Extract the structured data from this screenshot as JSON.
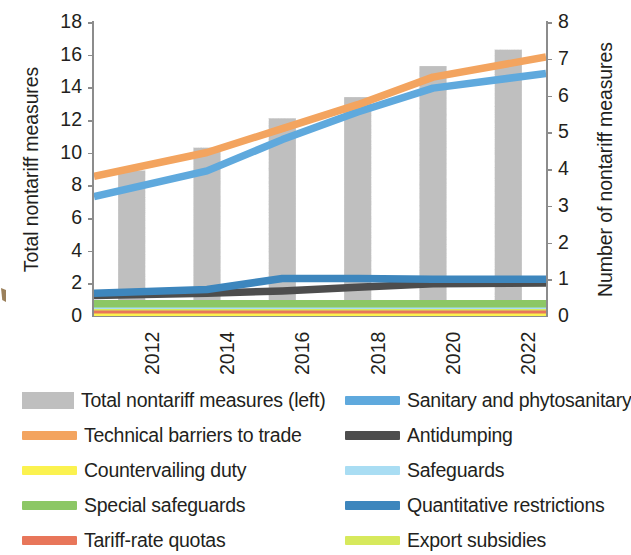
{
  "axes": {
    "y_left": {
      "title": "Total nontariff measures",
      "ticks": [
        "18",
        "16",
        "14",
        "12",
        "10",
        "8",
        "6",
        "4",
        "2",
        "0"
      ],
      "min": 0,
      "max": 18,
      "step": 2
    },
    "y_right": {
      "title": "Number of nontariff  measures",
      "ticks": [
        "8",
        "7",
        "6",
        "5",
        "4",
        "3",
        "2",
        "1",
        "0"
      ],
      "min": 0,
      "max": 8,
      "step": 1
    },
    "x": {
      "ticks": [
        "2012",
        "2014",
        "2016",
        "2018",
        "2020",
        "2022"
      ]
    }
  },
  "legend": {
    "left_column": [
      {
        "label": "Total  nontariff measures (left)",
        "color": "#bfbfbf",
        "style": "patch",
        "icon": "bar-swatch-icon"
      },
      {
        "label": "Technical barriers to trade",
        "color": "#f3a45f",
        "style": "line",
        "icon": "line-swatch-icon"
      },
      {
        "label": "Countervailing duty",
        "color": "#fbf24f",
        "style": "line",
        "icon": "line-swatch-icon"
      },
      {
        "label": "Special safeguards",
        "color": "#8cc765",
        "style": "line",
        "icon": "line-swatch-icon"
      },
      {
        "label": "Tariff-rate quotas",
        "color": "#e8765a",
        "style": "line",
        "icon": "line-swatch-icon"
      }
    ],
    "right_column": [
      {
        "label": "Sanitary and phytosanitary",
        "color": "#5fa9dd",
        "style": "line",
        "icon": "line-swatch-icon"
      },
      {
        "label": "Antidumping",
        "color": "#4d4d4d",
        "style": "line",
        "icon": "line-swatch-icon"
      },
      {
        "label": "Safeguards",
        "color": "#a9ddf3",
        "style": "line",
        "icon": "line-swatch-icon"
      },
      {
        "label": "Quantitative restrictions",
        "color": "#3d86bd",
        "style": "line",
        "icon": "line-swatch-icon"
      },
      {
        "label": "Export subsidies",
        "color": "#d7e95c",
        "style": "line",
        "icon": "line-swatch-icon"
      }
    ]
  },
  "chart_data": {
    "type": "bar",
    "title": "",
    "xlabel": "",
    "ylabel": "Total nontariff measures",
    "y2label": "Number of nontariff  measures",
    "grid": false,
    "legend_position": "bottom",
    "categories": [
      "2012",
      "2014",
      "2016",
      "2018",
      "2020",
      "2022"
    ],
    "ylim": [
      0,
      18
    ],
    "y2lim": [
      0,
      8
    ],
    "bars": {
      "name": "Total  nontariff measures (left)",
      "axis": "left",
      "color": "#bfbfbf",
      "values": [
        8.9,
        10.3,
        12.1,
        13.4,
        15.3,
        16.3
      ]
    },
    "series": [
      {
        "name": "Technical barriers to trade",
        "axis": "right",
        "color": "#f3a45f",
        "values": [
          3.8,
          4.45,
          5.1,
          5.75,
          6.5,
          7.05
        ]
      },
      {
        "name": "Sanitary and phytosanitary",
        "axis": "right",
        "color": "#5fa9dd",
        "values": [
          3.25,
          3.95,
          4.8,
          5.55,
          6.2,
          6.6
        ]
      },
      {
        "name": "Quantitative restrictions",
        "axis": "right",
        "color": "#3d86bd",
        "values": [
          0.62,
          0.72,
          1.02,
          1.02,
          1.0,
          1.0
        ]
      },
      {
        "name": "Antidumping",
        "axis": "right",
        "color": "#4d4d4d",
        "values": [
          0.56,
          0.62,
          0.68,
          0.78,
          0.88,
          0.9
        ]
      },
      {
        "name": "Special safeguards",
        "axis": "right",
        "color": "#8cc765",
        "values": [
          0.33,
          0.33,
          0.33,
          0.33,
          0.33,
          0.33
        ]
      },
      {
        "name": "Safeguards",
        "axis": "right",
        "color": "#a9ddf3",
        "values": [
          0.29,
          0.29,
          0.29,
          0.29,
          0.29,
          0.29
        ]
      },
      {
        "name": "Export subsidies",
        "axis": "right",
        "color": "#d7e95c",
        "values": [
          0.25,
          0.25,
          0.25,
          0.25,
          0.25,
          0.25
        ]
      },
      {
        "name": "Tariff-rate quotas",
        "axis": "right",
        "color": "#e8765a",
        "values": [
          0.17,
          0.17,
          0.17,
          0.17,
          0.17,
          0.17
        ]
      },
      {
        "name": "Countervailing duty",
        "axis": "right",
        "color": "#fbf24f",
        "values": [
          0.06,
          0.06,
          0.06,
          0.06,
          0.06,
          0.06
        ]
      }
    ]
  }
}
